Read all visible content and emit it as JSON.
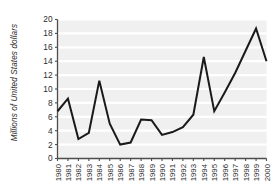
{
  "chart_data": {
    "type": "line",
    "title": "",
    "subtitle": "",
    "xlabel": "",
    "ylabel": "Millions of United States dollars",
    "categories": [
      "1980",
      "1981",
      "1982",
      "1983",
      "1984",
      "1985",
      "1986",
      "1987",
      "1988",
      "1989",
      "1990",
      "1991",
      "1992",
      "1993",
      "1994",
      "1995",
      "1996",
      "1997",
      "1998",
      "1999",
      "2000"
    ],
    "values": [
      6.8,
      8.6,
      2.8,
      3.7,
      11.2,
      5.0,
      2.0,
      2.3,
      5.6,
      5.5,
      3.4,
      3.8,
      4.5,
      6.3,
      14.6,
      6.8,
      9.5,
      12.3,
      15.5,
      18.7,
      14.0
    ],
    "ylim": [
      0,
      20
    ],
    "ytick_labels": [
      "0",
      "2",
      "4",
      "6",
      "8",
      "10",
      "12",
      "14",
      "16",
      "18",
      "20"
    ],
    "ytick_values": [
      0,
      2,
      4,
      6,
      8,
      10,
      12,
      14,
      16,
      18,
      20
    ],
    "grid": "horizontal",
    "grid_color": "#ffffff",
    "plot_background": "#f0f0f0",
    "line_color": "#1a1a1a",
    "axis_color": "#4d4d4d",
    "legend": null,
    "legend_position": "none",
    "annotations": []
  },
  "figure": {
    "background": "#ffffff",
    "xtick_rotation_degrees": 90
  }
}
